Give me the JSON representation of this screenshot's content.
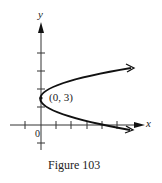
{
  "figure": {
    "caption": "Figure 103",
    "axes": {
      "x_label": "x",
      "y_label": "y",
      "origin_label": "0"
    },
    "vertex": {
      "label": "(0, 3)",
      "x": 0,
      "y": 3
    },
    "curve": {
      "type": "parabola opening right",
      "description": "Parabola with vertex at (0, 3), opening to the right, arrows on both ends"
    },
    "colors": {
      "ink": "#111111",
      "background": "#ffffff"
    }
  }
}
